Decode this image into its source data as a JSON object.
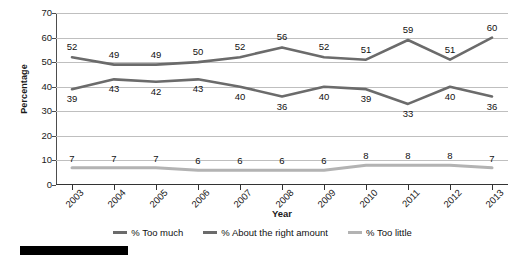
{
  "chart_data": {
    "type": "line",
    "title": "",
    "xlabel": "Year",
    "ylabel": "Percentage",
    "categories": [
      "2003",
      "2004",
      "2005",
      "2006",
      "2007",
      "2008",
      "2009",
      "2010",
      "2011",
      "2012",
      "2013"
    ],
    "x": [
      2003,
      2004,
      2005,
      2006,
      2007,
      2008,
      2009,
      2010,
      2011,
      2012,
      2013
    ],
    "ylim": [
      0,
      70
    ],
    "yticks": [
      0,
      10,
      20,
      30,
      40,
      50,
      60,
      70
    ],
    "grid": true,
    "legend_position": "bottom",
    "data_labels": true,
    "series": [
      {
        "name": "% Too much",
        "color": "#6b6b6b",
        "values": [
          52,
          49,
          49,
          50,
          52,
          56,
          52,
          51,
          59,
          51,
          60
        ]
      },
      {
        "name": "% About the right amount",
        "color": "#6b6b6b",
        "values": [
          39,
          43,
          42,
          43,
          40,
          36,
          40,
          39,
          33,
          40,
          36
        ]
      },
      {
        "name": "% Too little",
        "color": "#b3b3b3",
        "values": [
          7,
          7,
          7,
          6,
          6,
          6,
          6,
          8,
          8,
          8,
          7
        ]
      }
    ]
  },
  "axes": {
    "y_title": "Percentage",
    "x_title": "Year",
    "y_tick_labels": [
      "70",
      "60",
      "50",
      "40",
      "30",
      "20",
      "10",
      "0"
    ],
    "x_tick_labels": [
      "2003",
      "2004",
      "2005",
      "2006",
      "2007",
      "2008",
      "2009",
      "2010",
      "2011",
      "2012",
      "2013"
    ]
  },
  "legend": {
    "items": [
      {
        "label": "% Too much",
        "color": "#6b6b6b"
      },
      {
        "label": "% About the right amount",
        "color": "#6b6b6b"
      },
      {
        "label": "% Too little",
        "color": "#b3b3b3"
      }
    ]
  },
  "colors": {
    "series_dark": "#6b6b6b",
    "series_light": "#b3b3b3",
    "gridline": "#bfbfbf",
    "axis": "#333333",
    "text": "#111111",
    "bottom_bar": "#000000"
  }
}
